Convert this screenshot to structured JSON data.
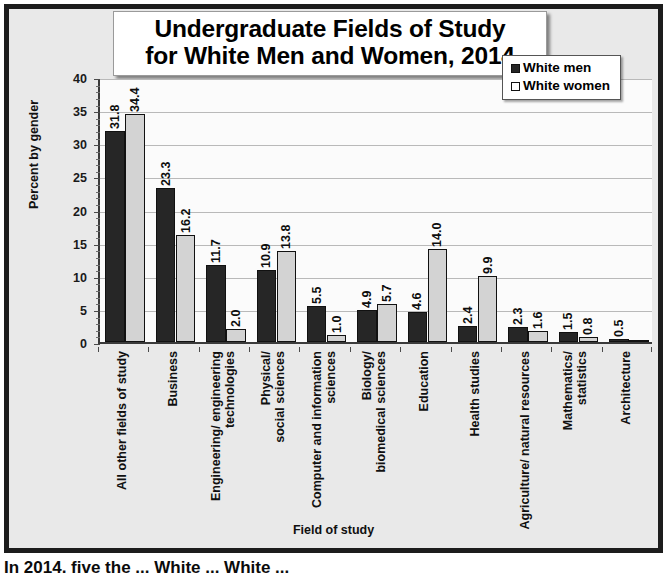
{
  "title": {
    "line1": "Undergraduate Fields of Study",
    "line2": "for White Men and Women, 2014"
  },
  "legend": {
    "position": "top-right",
    "items": [
      {
        "label": "White men",
        "swatch": "dark-filled-square"
      },
      {
        "label": "White women",
        "swatch": "white-hollow-square"
      }
    ]
  },
  "axes": {
    "ylabel": "Percent by gender",
    "xlabel": "Field of study",
    "yticks": [
      "0",
      "5",
      "10",
      "15",
      "20",
      "25",
      "30",
      "35",
      "40"
    ]
  },
  "caption": "In 2014, five the ...                          White ...                          White ...",
  "colors": {
    "men": "#262626",
    "women": "#d3d3d3",
    "frame": "#1c1c1c",
    "background": "#e9e9e9",
    "plot_background": "#fbfbfb",
    "gridline": "#b9b9b9"
  },
  "chart_data": {
    "type": "bar",
    "title": "Undergraduate Fields of Study for White Men and Women, 2014",
    "xlabel": "Field of study",
    "ylabel": "Percent by gender",
    "ylim": [
      0,
      40
    ],
    "ytick_step": 5,
    "grid": true,
    "legend_position": "top-right",
    "categories": [
      "All other fields of study",
      "Business",
      "Engineering/ engineering technologies",
      "Physical/ social sciences",
      "Computer and information sciences",
      "Biology/ biomedical sciences",
      "Education",
      "Health studies",
      "Agriculture/ natural resources",
      "Mathematics/ statistics",
      "Architecture"
    ],
    "series": [
      {
        "name": "White men",
        "values": [
          31.8,
          23.3,
          11.7,
          10.9,
          5.5,
          4.9,
          4.6,
          2.4,
          2.3,
          1.5,
          0.5
        ],
        "labels": [
          "31.8",
          "23.3",
          "11.7",
          "10.9",
          "5.5",
          "4.9",
          "4.6",
          "2.4",
          "2.3",
          "1.5",
          "0.5"
        ]
      },
      {
        "name": "White women",
        "values": [
          34.4,
          16.2,
          2.0,
          13.8,
          1.0,
          5.7,
          14.0,
          9.9,
          1.6,
          0.8,
          0.2
        ],
        "labels": [
          "34.4",
          "16.2",
          "2.0",
          "13.8",
          "1.0",
          "5.7",
          "14.0",
          "9.9",
          "1.6",
          "0.8",
          ""
        ]
      }
    ]
  }
}
